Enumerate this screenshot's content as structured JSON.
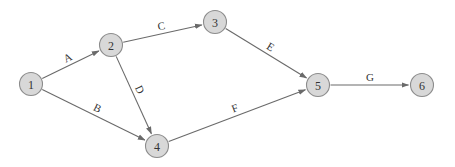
{
  "diagram": {
    "type": "activity-on-arrow network",
    "colors": {
      "node_fill": "#d8d8d8",
      "node_stroke": "#8c8c8c",
      "edge": "#6a6a6a",
      "text": "#333333"
    },
    "nodes": [
      {
        "id": "1",
        "label": "1",
        "x": 31,
        "y": 84
      },
      {
        "id": "2",
        "label": "2",
        "x": 111,
        "y": 45
      },
      {
        "id": "3",
        "label": "3",
        "x": 215,
        "y": 22
      },
      {
        "id": "4",
        "label": "4",
        "x": 157,
        "y": 146
      },
      {
        "id": "5",
        "label": "5",
        "x": 318,
        "y": 85
      },
      {
        "id": "6",
        "label": "6",
        "x": 422,
        "y": 85
      }
    ],
    "edges": [
      {
        "label": "A",
        "from": "1",
        "to": "2"
      },
      {
        "label": "B",
        "from": "1",
        "to": "4"
      },
      {
        "label": "C",
        "from": "2",
        "to": "3"
      },
      {
        "label": "D",
        "from": "2",
        "to": "4"
      },
      {
        "label": "E",
        "from": "3",
        "to": "5"
      },
      {
        "label": "F",
        "from": "4",
        "to": "5"
      },
      {
        "label": "G",
        "from": "5",
        "to": "6"
      }
    ]
  }
}
